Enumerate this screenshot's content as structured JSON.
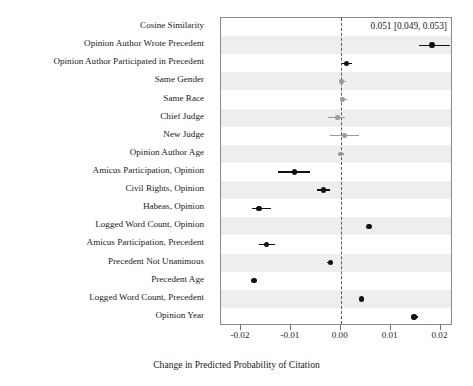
{
  "chart_data": {
    "type": "scatter",
    "plot_style": "forest-plot",
    "title": "",
    "xlabel": "Change in Predicted Probability of Citation",
    "ylabel": "",
    "xlim": [
      -0.024,
      0.0225
    ],
    "xticks": [
      -0.02,
      -0.01,
      0.0,
      0.01,
      0.02
    ],
    "xticklabels": [
      "-0.02",
      "-0.01",
      "0.00",
      "0.01",
      "0.02"
    ],
    "grid": false,
    "legend": "none",
    "reference_line": {
      "x": 0.0,
      "style": "dashed",
      "color": "#5a5a5a"
    },
    "annotations": [
      {
        "text": "0.051 [0.049, 0.053]",
        "row": "Cosine Similarity",
        "note": "estimate off-scale, shown as text"
      }
    ],
    "colors": {
      "significant": "#111111",
      "nonsignificant": "#9a9a9a",
      "band": "#eeeeee"
    },
    "categories": [
      "Cosine Similarity",
      "Opinion Author Wrote Precedent",
      "Opinion Author Participated in Precedent",
      "Same Gender",
      "Same Race",
      "Chief Judge",
      "New Judge",
      "Opinion Author Age",
      "Amicus Participation, Opinion",
      "Civil Rights, Opinion",
      "Habeas, Opinion",
      "Logged Word Count, Opinion",
      "Amicus Participation, Precedent",
      "Precedent Not Unanimous",
      "Precedent Age",
      "Logged Word Count, Precedent",
      "Opinion Year"
    ],
    "points": [
      {
        "label": "Cosine Similarity",
        "estimate": 0.051,
        "ci_low": 0.049,
        "ci_high": 0.053,
        "significant": true,
        "offscale": true
      },
      {
        "label": "Opinion Author Wrote Precedent",
        "estimate": 0.0183,
        "ci_low": 0.0157,
        "ci_high": 0.0219,
        "significant": true,
        "offscale": false
      },
      {
        "label": "Opinion Author Participated in Precedent",
        "estimate": 0.0012,
        "ci_low": 0.0002,
        "ci_high": 0.0022,
        "significant": true,
        "offscale": false
      },
      {
        "label": "Same Gender",
        "estimate": 0.0002,
        "ci_low": -0.0004,
        "ci_high": 0.001,
        "significant": false,
        "offscale": false
      },
      {
        "label": "Same Race",
        "estimate": 0.0004,
        "ci_low": -0.0002,
        "ci_high": 0.0012,
        "significant": false,
        "offscale": false
      },
      {
        "label": "Chief Judge",
        "estimate": -0.0006,
        "ci_low": -0.0025,
        "ci_high": 0.0008,
        "significant": false,
        "offscale": false
      },
      {
        "label": "New Judge",
        "estimate": 0.0008,
        "ci_low": -0.0021,
        "ci_high": 0.0036,
        "significant": false,
        "offscale": false
      },
      {
        "label": "Opinion Author Age",
        "estimate": 0.0,
        "ci_low": -0.0006,
        "ci_high": 0.0006,
        "significant": false,
        "offscale": false
      },
      {
        "label": "Amicus Participation, Opinion",
        "estimate": -0.0093,
        "ci_low": -0.0125,
        "ci_high": -0.0062,
        "significant": true,
        "offscale": false
      },
      {
        "label": "Civil Rights, Opinion",
        "estimate": -0.0034,
        "ci_low": -0.0048,
        "ci_high": -0.0021,
        "significant": true,
        "offscale": false
      },
      {
        "label": "Habeas, Opinion",
        "estimate": -0.0164,
        "ci_low": -0.0178,
        "ci_high": -0.014,
        "significant": true,
        "offscale": false
      },
      {
        "label": "Logged Word Count, Opinion",
        "estimate": 0.0057,
        "ci_low": 0.0052,
        "ci_high": 0.0062,
        "significant": true,
        "offscale": false
      },
      {
        "label": "Amicus Participation, Precedent",
        "estimate": -0.0149,
        "ci_low": -0.0163,
        "ci_high": -0.0132,
        "significant": true,
        "offscale": false
      },
      {
        "label": "Precedent Not Unanimous",
        "estimate": -0.0021,
        "ci_low": -0.0027,
        "ci_high": -0.0015,
        "significant": true,
        "offscale": false
      },
      {
        "label": "Precedent Age",
        "estimate": -0.0174,
        "ci_low": -0.0179,
        "ci_high": -0.0169,
        "significant": true,
        "offscale": false
      },
      {
        "label": "Logged Word Count, Precedent",
        "estimate": 0.0042,
        "ci_low": 0.0038,
        "ci_high": 0.0047,
        "significant": true,
        "offscale": false
      },
      {
        "label": "Opinion Year",
        "estimate": 0.0147,
        "ci_low": 0.014,
        "ci_high": 0.0154,
        "significant": true,
        "offscale": false
      }
    ]
  }
}
